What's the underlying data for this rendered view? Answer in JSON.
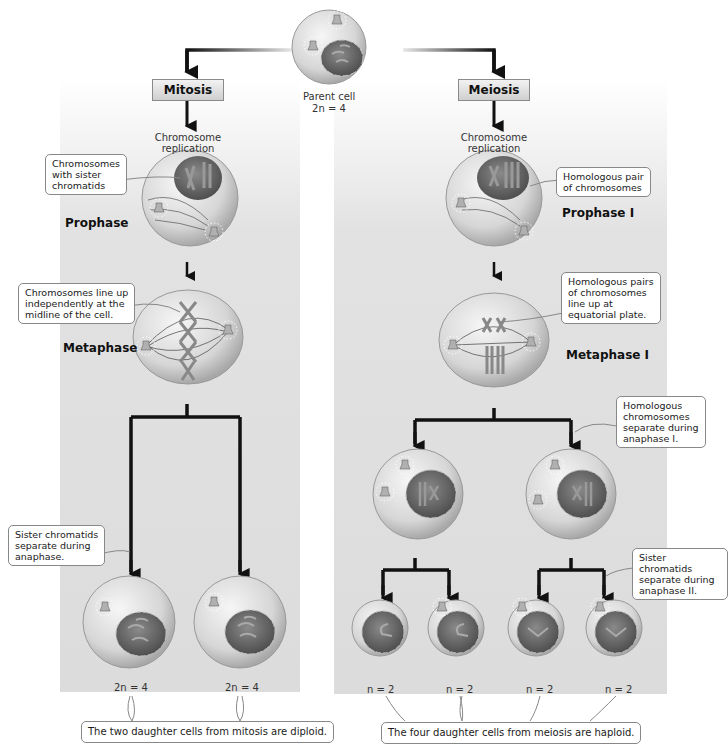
{
  "parent": {
    "label": "Parent cell",
    "ploidy": "2n = 4"
  },
  "mitosis": {
    "title": "Mitosis",
    "replication_label": "Chromosome\nreplication",
    "phases": [
      {
        "name": "Prophase",
        "callout": "Chromosomes\nwith sister\nchromatids"
      },
      {
        "name": "Metaphase",
        "callout": "Chromosomes line up\nindependently at the\nmidline of the cell."
      }
    ],
    "anaphase_callout": "Sister chromatids\nseparate during\nanaphase.",
    "daughter_ploidy": [
      "2n = 4",
      "2n = 4"
    ],
    "summary": "The two daughter cells from mitosis are diploid."
  },
  "meiosis": {
    "title": "Meiosis",
    "replication_label": "Chromosome\nreplication",
    "phases": [
      {
        "name": "Prophase I",
        "callout": "Homologous pair\nof chromosomes"
      },
      {
        "name": "Metaphase I",
        "callout": "Homologous pairs\nof chromosomes\nline up at\nequatorial plate."
      }
    ],
    "anaphase1_callout": "Homologous\nchromosomes\nseparate during\nanaphase I.",
    "anaphase2_callout": "Sister chromatids\nseparate during\nanaphase II.",
    "daughter_ploidy": [
      "n = 2",
      "n = 2",
      "n = 2",
      "n = 2"
    ],
    "summary": "The four daughter cells from meiosis are haploid."
  },
  "colors": {
    "panel_bg": "#dcdcdc",
    "cell_fill": "#d8d8d8",
    "nucleus_fill": "#6a6a6a",
    "arrow": "#111111",
    "callout_border": "#888888"
  }
}
